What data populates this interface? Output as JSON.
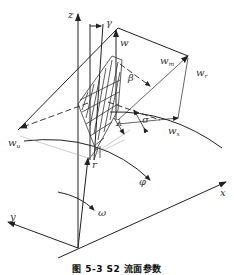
{
  "figure": {
    "caption": "图 5-3   S2 流面参数",
    "line_color": "#222222",
    "hatch_color": "#333333"
  },
  "labels": {
    "z": "z",
    "y_top": "γ",
    "w": "w",
    "w_m": "w",
    "w_m_sub": "m",
    "w_r": "w",
    "w_r_sub": "r",
    "beta": "β",
    "sigma": "σ",
    "lambda": "λ",
    "w_x": "w",
    "w_x_sub": "x",
    "w_u": "w",
    "w_u_sub": "u",
    "r": "r",
    "phi": "φ",
    "omega": "ω",
    "x": "x",
    "y": "y"
  }
}
